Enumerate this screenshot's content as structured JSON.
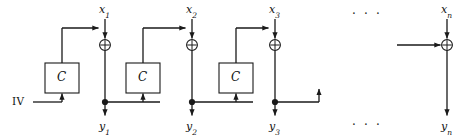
{
  "diagram": {
    "colors": {
      "stroke": "#1a1a1a",
      "text": "#111111",
      "background": "#ffffff",
      "box_fill": "#ffffff"
    },
    "geometry": {
      "width": 470,
      "height": 140,
      "xor_y": 45,
      "tap_y": 102,
      "block_top": 63,
      "block_bottom": 93,
      "feedback_y": 28,
      "iv_y": 102
    },
    "stages": [
      {
        "id": "stage-1",
        "input_label": "x",
        "input_sub": "1",
        "output_label": "y",
        "output_sub": "1",
        "xor_x": 105,
        "block_label": "C",
        "block_x": 62,
        "has_block": true,
        "has_tap_dot": true
      },
      {
        "id": "stage-2",
        "input_label": "x",
        "input_sub": "2",
        "output_label": "y",
        "output_sub": "2",
        "xor_x": 192,
        "block_label": "C",
        "block_x": 143,
        "has_block": true,
        "has_tap_dot": true
      },
      {
        "id": "stage-3",
        "input_label": "x",
        "input_sub": "3",
        "output_label": "y",
        "output_sub": "3",
        "xor_x": 275,
        "block_label": "C",
        "block_x": 236,
        "has_block": true,
        "has_tap_dot": true
      },
      {
        "id": "stage-n",
        "input_label": "x",
        "input_sub": "n",
        "output_label": "y",
        "output_sub": "n",
        "xor_x": 447,
        "block_label": "",
        "block_x": 0,
        "has_block": false,
        "has_tap_dot": false
      }
    ],
    "iv": {
      "label": "IV",
      "x": 12,
      "y": 96
    },
    "ellipses": [
      {
        "id": "ellipsis-top",
        "text": "· · ·",
        "x": 352,
        "y": 9
      },
      {
        "id": "ellipsis-bottom",
        "text": "· · ·",
        "x": 352,
        "y": 120
      }
    ],
    "xor_symbol": "⊕",
    "icon_names": {
      "xor": "xor-gate-icon",
      "cipher_block": "cipher-block-icon",
      "junction": "junction-dot-icon",
      "arrow": "arrowhead-icon"
    }
  }
}
